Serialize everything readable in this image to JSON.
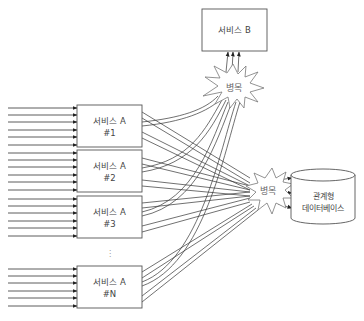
{
  "diagram": {
    "service_b": {
      "label": "서비스 B"
    },
    "service_a_instances": [
      {
        "line1": "서비스 A",
        "line2": "#1"
      },
      {
        "line1": "서비스 A",
        "line2": "#2"
      },
      {
        "line1": "서비스 A",
        "line2": "#3"
      },
      {
        "line1": "서비스 A",
        "line2": "#N"
      }
    ],
    "ellipsis": "⋮",
    "bottleneck_top": {
      "label": "병목"
    },
    "bottleneck_right": {
      "label": "병목"
    },
    "database": {
      "line1": "관계형",
      "line2": "데이터베이스"
    },
    "inputs_per_instance": 6,
    "colors": {
      "stroke": "#333333",
      "box_fill": "#ffffff",
      "text": "#444444"
    }
  }
}
